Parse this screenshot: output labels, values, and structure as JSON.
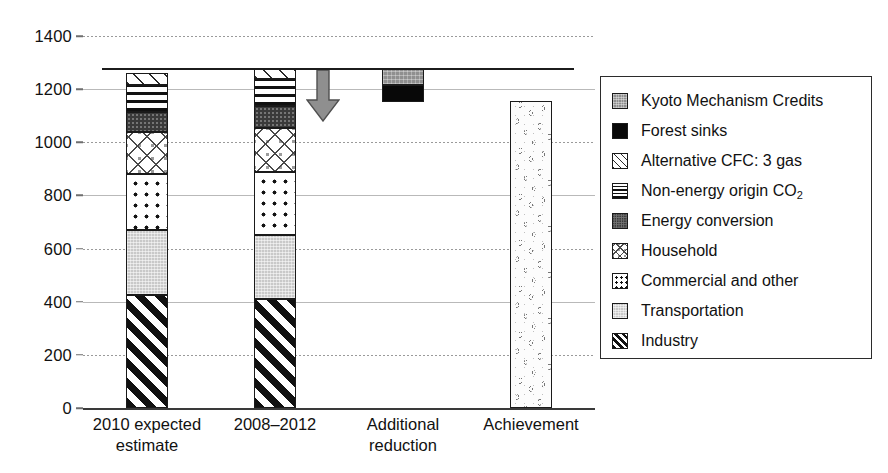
{
  "chart_data": {
    "type": "bar",
    "title": "",
    "subtitle": "",
    "xlabel": "",
    "ylabel": "",
    "ylim": [
      0,
      1400
    ],
    "ytick_step": 200,
    "yticks": [
      "0",
      "200",
      "400",
      "600",
      "800",
      "1000",
      "1200",
      "1400"
    ],
    "grid": true,
    "grid_axis": "y",
    "legend_position": "right",
    "stacked": true,
    "categories": [
      "2010 expected estimate",
      "2008–2012",
      "Additional reduction",
      "Achievement"
    ],
    "category_lines": [
      [
        "2010 expected",
        "estimate"
      ],
      [
        "2008–2012"
      ],
      [
        "Additional",
        "reduction"
      ],
      [
        "Achievement"
      ]
    ],
    "series": [
      {
        "name": "Industry",
        "key": "industry",
        "values": [
          425,
          410,
          0,
          0
        ]
      },
      {
        "name": "Transportation",
        "key": "transport",
        "values": [
          245,
          240,
          0,
          0
        ]
      },
      {
        "name": "Commercial and other",
        "key": "commercial",
        "values": [
          210,
          240,
          0,
          0
        ]
      },
      {
        "name": "Household",
        "key": "household",
        "values": [
          160,
          165,
          0,
          0
        ]
      },
      {
        "name": "Energy conversion",
        "key": "energyconv",
        "values": [
          75,
          80,
          0,
          0
        ]
      },
      {
        "name": "Non-energy origin CO2",
        "key": "nonenergy",
        "values": [
          100,
          105,
          0,
          0
        ]
      },
      {
        "name": "Alternative CFC: 3 gas",
        "key": "altcfc",
        "values": [
          45,
          35,
          0,
          0
        ]
      },
      {
        "name": "Forest sinks",
        "key": "forest",
        "values": [
          0,
          0,
          65,
          0
        ]
      },
      {
        "name": "Kyoto Mechanism Credits",
        "key": "kyoto",
        "values": [
          0,
          0,
          60,
          0
        ]
      },
      {
        "name": "Achievement",
        "key": "achievement",
        "values": [
          0,
          0,
          0,
          1155
        ]
      }
    ],
    "totals": [
      1260,
      1275,
      1275,
      1155
    ],
    "bar3_base": 1150,
    "annotations": [
      {
        "type": "reference-line",
        "label": "target level",
        "value": 1280
      },
      {
        "type": "arrow",
        "label": "reduction arrow",
        "direction": "down",
        "from": 1280,
        "to": 1140
      }
    ]
  },
  "legend": {
    "items": [
      {
        "label": "Kyoto Mechanism Credits",
        "pattern": "kyoto",
        "color": "#8f8f8f"
      },
      {
        "label": "Forest sinks",
        "pattern": "forest",
        "color": "#080808"
      },
      {
        "label": "Alternative CFC: 3 gas",
        "pattern": "altcfc",
        "color": "#2a2a2a"
      },
      {
        "label": "Non-energy origin CO",
        "pattern": "nonenergy",
        "color": "#111111",
        "sub": "2"
      },
      {
        "label": "Energy conversion",
        "pattern": "energyconv",
        "color": "#3a3a3a"
      },
      {
        "label": "Household",
        "pattern": "household",
        "color": "#9b9b9b"
      },
      {
        "label": "Commercial and other",
        "pattern": "commercial",
        "color": "#111111"
      },
      {
        "label": "Transportation",
        "pattern": "transport",
        "color": "#c9c9c9"
      },
      {
        "label": "Industry",
        "pattern": "industry",
        "color": "#111111"
      }
    ]
  },
  "colors": {
    "axis": "#3a3a3a",
    "grid": "#9a9a9a",
    "text": "#111111",
    "reference_line": "#1c1c1c",
    "arrow": "#8f8f8f",
    "legend_border": "#2b2b2b"
  }
}
